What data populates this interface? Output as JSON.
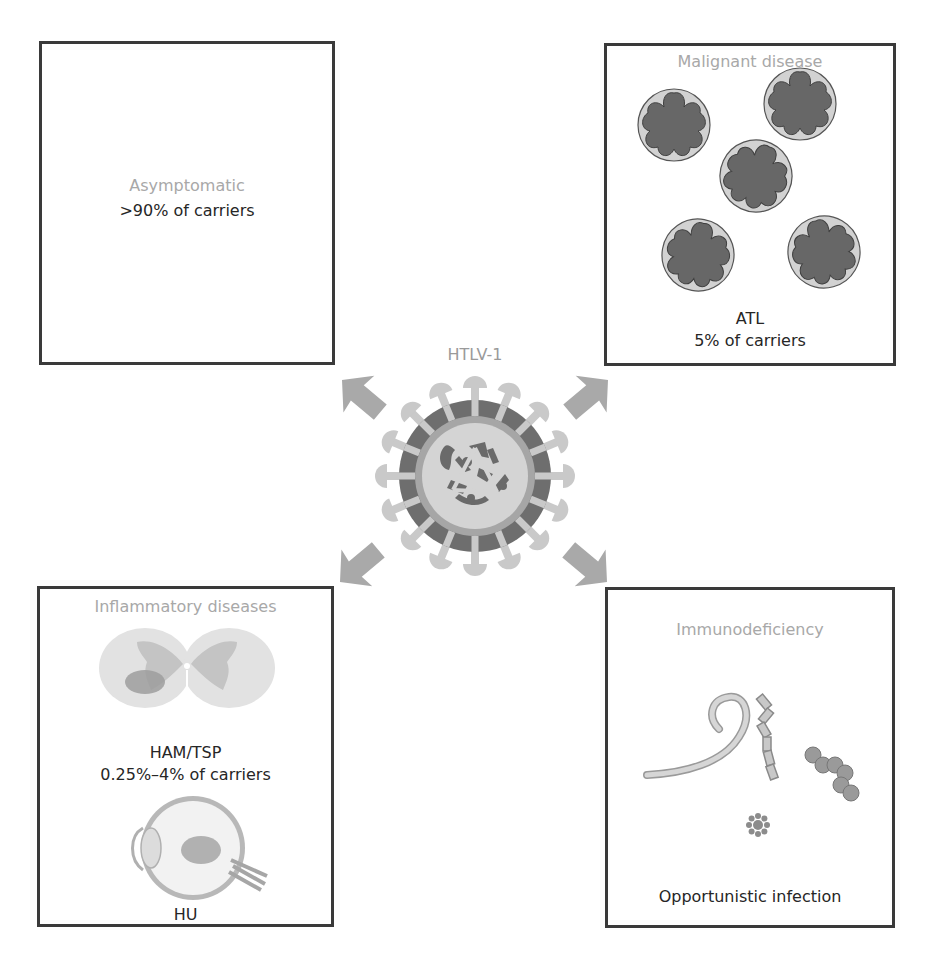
{
  "center": {
    "title": "HTLV-1",
    "icon": "virus-icon"
  },
  "panels": {
    "asymptomatic": {
      "title": "Asymptomatic",
      "label": ">90% of carriers"
    },
    "malignant": {
      "title": "Malignant disease",
      "label_line1": "ATL",
      "label_line2": "5% of carriers",
      "icon": "flower-cell-icon"
    },
    "inflammatory": {
      "title": "Inflammatory diseases",
      "label1_line1": "HAM/TSP",
      "label1_line2": "0.25%–4%  of carriers",
      "label2": "HU",
      "icons": [
        "spinal-cord-icon",
        "eye-icon"
      ]
    },
    "immunodeficiency": {
      "title": "Immunodeficiency",
      "label": "Opportunistic infection",
      "icons": [
        "worm-icon",
        "bacillus-chain-icon",
        "coccus-chain-icon",
        "fungus-icon"
      ]
    }
  },
  "colors": {
    "panel_border": "#3a3a3a",
    "title_gray": "#a8a8a8",
    "arrow": "#a9a9a9",
    "virus_ring_dark": "#6e6e6e",
    "virus_ring_mid": "#a6a6a6",
    "virus_core": "#d4d4d4",
    "cell_dark": "#6a6a6a",
    "cell_light": "#cfcfcf"
  }
}
